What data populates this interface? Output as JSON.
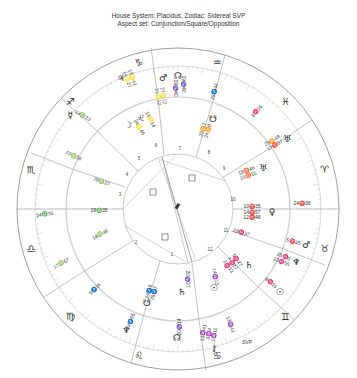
{
  "header": {
    "line1": "House System: Placidus, Zodiac: Sidereal SVP",
    "line2": "Aspect set: Conjunction/Square/Opposition"
  },
  "chart": {
    "center": [
      178,
      209
    ],
    "radii": {
      "outer": 161,
      "zodiac_inner": 143,
      "house_outer": 112,
      "inner": 55
    },
    "colors": {
      "line": "#777777",
      "tick": "#bbbbbb",
      "text": "#333333",
      "aspect": "#999999"
    },
    "signs": [
      {
        "name": "aries",
        "glyph": "♈",
        "angle": 0
      },
      {
        "name": "pisces",
        "glyph": "♓",
        "angle": 30
      },
      {
        "name": "aquarius",
        "glyph": "♒",
        "angle": 60
      },
      {
        "name": "capricorn",
        "glyph": "♑",
        "angle": 90
      },
      {
        "name": "sagittarius",
        "glyph": "♐",
        "angle": 120
      },
      {
        "name": "scorpio",
        "glyph": "♏",
        "angle": 150
      },
      {
        "name": "libra",
        "glyph": "♎",
        "angle": 180
      },
      {
        "name": "virgo",
        "glyph": "♍",
        "angle": 210
      },
      {
        "name": "leo",
        "glyph": "♌",
        "angle": 240
      },
      {
        "name": "cancer",
        "glyph": "♋",
        "angle": 270
      },
      {
        "name": "gemini",
        "glyph": "♊",
        "angle": 300
      },
      {
        "name": "taurus",
        "glyph": "♉",
        "angle": 330
      }
    ],
    "house_cusps": [
      {
        "label": "19♎35",
        "angle": 180
      },
      {
        "label": "24♎35",
        "angle": 173
      },
      {
        "label": "29♍37",
        "angle": 200
      },
      {
        "label": "23♍56",
        "angle": 197
      },
      {
        "label": "18♍46",
        "angle": 160
      },
      {
        "label": "17♏57",
        "angle": 155
      },
      {
        "label": "5♐16",
        "angle": 140
      },
      {
        "label": "25♐44",
        "angle": 112
      },
      {
        "label": "19♑40",
        "angle": 88
      },
      {
        "label": "25♒44",
        "angle": 73
      },
      {
        "label": "8♓16",
        "angle": 40
      },
      {
        "label": "24♈38",
        "angle": 2
      },
      {
        "label": "29♓37",
        "angle": 345
      },
      {
        "label": "13♉41",
        "angle": 295
      }
    ],
    "house_numbers": [
      "1",
      "2",
      "3",
      "4",
      "5",
      "6",
      "7",
      "8",
      "9",
      "10",
      "11",
      "12"
    ],
    "planets": [
      {
        "name": "moon",
        "glyph": "☽",
        "pos": "24♌46"
      },
      {
        "name": "mercury",
        "glyph": "☿",
        "pos": "13♍23"
      },
      {
        "name": "jupiter",
        "glyph": "♃",
        "pos": "13♌41 / 14♌27"
      },
      {
        "name": "mars-top",
        "glyph": "♂",
        "pos": "27♌12 / 21♌12"
      },
      {
        "name": "leo-planet",
        "glyph": "♌",
        "pos": "13♌14"
      },
      {
        "name": "north-node",
        "glyph": "☊",
        "pos": "19♑40"
      },
      {
        "name": "uranus",
        "glyph": "♅",
        "pos": "25♊44 / 17♈57"
      },
      {
        "name": "uranus-2",
        "glyph": "♅",
        "pos": "18♉46 / 15♉15"
      },
      {
        "name": "venus",
        "glyph": "♀",
        "pos": "10♈35 / 14♈57 / 12♈48"
      },
      {
        "name": "mars",
        "glyph": "♂",
        "pos": "5♈35"
      },
      {
        "name": "neptune",
        "glyph": "♆",
        "pos": "25♓0 / 23♓55"
      },
      {
        "name": "sun",
        "glyph": "☉",
        "pos": "8♓10"
      },
      {
        "name": "saturn",
        "glyph": "♄",
        "pos": "5♓27 / 4♓17 / 2♓13"
      },
      {
        "name": "sun-2",
        "glyph": "☉",
        "pos": "14♒12"
      },
      {
        "name": "pluto",
        "glyph": "♇",
        "pos": "24♐55 / 25♐44"
      },
      {
        "name": "south-node",
        "glyph": "☋",
        "pos": "24♐8 / 25♐7"
      },
      {
        "name": "saturn-2",
        "glyph": "♄",
        "pos": "20♑27"
      },
      {
        "name": "node-2",
        "glyph": "☊",
        "pos": "20♑14"
      },
      {
        "name": "chiron",
        "glyph": "⚷",
        "pos": "13♒41"
      }
    ],
    "aspect_symbol": "□",
    "footer_mark": "SVP"
  }
}
